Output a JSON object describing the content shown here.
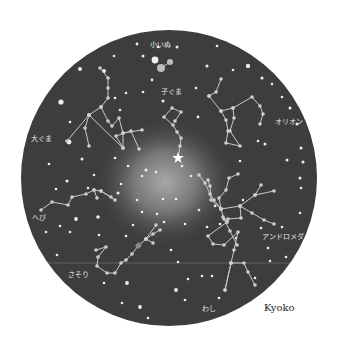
{
  "chart": {
    "center": [
      169,
      178
    ],
    "radius": 148,
    "sky_color": "#3d3d3d",
    "glow_center": [
      165,
      182
    ],
    "glow_color": "#9a9a9a",
    "line_color": "#c8c8c8",
    "star_color": "#eeeeee",
    "horizon_y": 263,
    "horizon_color": "#7a7a7a",
    "pole_star": {
      "x": 178,
      "y": 158
    }
  },
  "labels": {
    "koinu": "小いぬ",
    "kogumа": "子ぐま",
    "ookuma": "大ぐま",
    "orion": "オリオン",
    "hebi": "へび",
    "andromeda": "アンドロメダ",
    "sasori": "さそり",
    "washi": "わし"
  },
  "credit": "Kyoko",
  "constellations": [
    {
      "name": "koinu",
      "points": [
        [
          161,
          68
        ],
        [
          170,
          62
        ]
      ]
    },
    {
      "name": "kogumа",
      "points": [
        [
          178,
          158
        ],
        [
          180,
          146
        ],
        [
          181,
          138
        ],
        [
          177,
          132
        ],
        [
          173,
          125
        ],
        [
          164,
          117
        ],
        [
          172,
          108
        ],
        [
          181,
          112
        ],
        [
          175,
          121
        ]
      ]
    },
    {
      "name": "ookuma",
      "points": [
        [
          100,
          68
        ],
        [
          108,
          78
        ],
        [
          108,
          88
        ],
        [
          108,
          98
        ],
        [
          101,
          107
        ],
        [
          89,
          115
        ],
        [
          67,
          141
        ]
      ],
      "extra": [
        [
          [
            101,
            107
          ],
          [
            108,
            121
          ],
          [
            112,
            126
          ],
          [
            119,
            118
          ],
          [
            123,
            133
          ],
          [
            123,
            148
          ]
        ],
        [
          [
            89,
            115
          ],
          [
            85,
            128
          ],
          [
            89,
            146
          ]
        ],
        [
          [
            89,
            115
          ],
          [
            123,
            148
          ],
          [
            116,
            136
          ],
          [
            131,
            131
          ],
          [
            139,
            149
          ]
        ],
        [
          [
            123,
            133
          ],
          [
            142,
            130
          ]
        ]
      ]
    },
    {
      "name": "orion",
      "points": [
        [
          221,
          79
        ],
        [
          216,
          92
        ],
        [
          209,
          96
        ]
      ],
      "extra": [
        [
          [
            209,
            96
          ],
          [
            221,
            111
          ],
          [
            226,
            120
          ],
          [
            228,
            131
          ],
          [
            226,
            143
          ],
          [
            240,
            146
          ],
          [
            230,
            131
          ],
          [
            234,
            118
          ],
          [
            233,
            108
          ],
          [
            252,
            97
          ],
          [
            260,
            106
          ],
          [
            263,
            114
          ],
          [
            260,
            124
          ]
        ],
        [
          [
            221,
            111
          ],
          [
            233,
            108
          ]
        ]
      ]
    },
    {
      "name": "hebi",
      "points": [
        [
          41,
          210
        ],
        [
          52,
          202
        ],
        [
          68,
          205
        ],
        [
          72,
          197
        ],
        [
          86,
          194
        ],
        [
          94,
          190
        ],
        [
          101,
          191
        ],
        [
          111,
          197
        ]
      ],
      "extra": [
        [
          [
            94,
            190
          ],
          [
            97,
            198
          ]
        ],
        [
          [
            101,
            191
          ],
          [
            115,
            200
          ]
        ]
      ]
    },
    {
      "name": "andromeda",
      "points": [
        [
          199,
          175
        ],
        [
          205,
          183
        ],
        [
          210,
          194
        ],
        [
          214,
          200
        ],
        [
          221,
          209
        ],
        [
          240,
          206
        ],
        [
          255,
          195
        ],
        [
          274,
          191
        ]
      ],
      "extra": [
        [
          [
            221,
            209
          ],
          [
            224,
            219
          ],
          [
            230,
            231
          ],
          [
            237,
            245
          ]
        ],
        [
          [
            240,
            206
          ],
          [
            241,
            218
          ],
          [
            228,
            219
          ]
        ],
        [
          [
            240,
            206
          ],
          [
            252,
            213
          ],
          [
            264,
            220
          ],
          [
            274,
            224
          ]
        ],
        [
          [
            221,
            209
          ],
          [
            211,
            200
          ],
          [
            210,
            186
          ],
          [
            208,
            180
          ]
        ],
        [
          [
            221,
            209
          ],
          [
            219,
            198
          ],
          [
            226,
            190
          ],
          [
            229,
            178
          ],
          [
            238,
            174
          ]
        ],
        [
          [
            255,
            195
          ],
          [
            261,
            185
          ]
        ]
      ]
    },
    {
      "name": "sasori",
      "points": [
        [
          96,
          250
        ],
        [
          106,
          247
        ],
        [
          98,
          257
        ],
        [
          97,
          266
        ],
        [
          107,
          273
        ],
        [
          115,
          273
        ],
        [
          121,
          263
        ],
        [
          126,
          260
        ],
        [
          132,
          254
        ],
        [
          138,
          246
        ],
        [
          146,
          239
        ],
        [
          153,
          234
        ],
        [
          160,
          230
        ]
      ],
      "extra": [
        [
          [
            146,
            239
          ],
          [
            153,
            243
          ]
        ],
        [
          [
            146,
            239
          ],
          [
            156,
            225
          ]
        ]
      ]
    },
    {
      "name": "washi",
      "points": [
        [
          225,
          290
        ],
        [
          231,
          263
        ],
        [
          234,
          250
        ],
        [
          238,
          232
        ],
        [
          224,
          245
        ],
        [
          213,
          244
        ],
        [
          208,
          236
        ],
        [
          227,
          222
        ]
      ],
      "extra": [
        [
          [
            231,
            263
          ],
          [
            244,
            263
          ],
          [
            248,
            272
          ],
          [
            255,
            285
          ]
        ],
        [
          [
            231,
            263
          ],
          [
            225,
            290
          ]
        ],
        [
          [
            227,
            222
          ],
          [
            223,
            217
          ]
        ]
      ]
    }
  ],
  "stars": [
    [
      137,
      44,
      1.4
    ],
    [
      158,
      47,
      1.3
    ],
    [
      155,
      60,
      3.4
    ],
    [
      114,
      56,
      1.3
    ],
    [
      104,
      71,
      2.0
    ],
    [
      80,
      69,
      2.0
    ],
    [
      61,
      102,
      2.6
    ],
    [
      70,
      122,
      1.3
    ],
    [
      49,
      164,
      1.3
    ],
    [
      82,
      159,
      1.5
    ],
    [
      69,
      142,
      2.4
    ],
    [
      143,
      56,
      1.5
    ],
    [
      152,
      80,
      1.4
    ],
    [
      177,
      47,
      1.5
    ],
    [
      207,
      66,
      1.5
    ],
    [
      217,
      46,
      1.3
    ],
    [
      248,
      66,
      2.2
    ],
    [
      233,
      70,
      1.3
    ],
    [
      262,
      78,
      1.6
    ],
    [
      272,
      84,
      1.3
    ],
    [
      282,
      97,
      1.3
    ],
    [
      290,
      108,
      1.5
    ],
    [
      297,
      124,
      1.5
    ],
    [
      301,
      148,
      1.5
    ],
    [
      303,
      162,
      1.5
    ],
    [
      300,
      178,
      1.5
    ],
    [
      287,
      160,
      1.5
    ],
    [
      265,
      144,
      1.5
    ],
    [
      258,
      141,
      1.3
    ],
    [
      240,
      161,
      1.3
    ],
    [
      198,
      117,
      1.4
    ],
    [
      143,
      92,
      1.3
    ],
    [
      163,
      101,
      1.5
    ],
    [
      196,
      88,
      1.3
    ],
    [
      126,
      93,
      1.3
    ],
    [
      115,
      98,
      1.3
    ],
    [
      56,
      189,
      1.3
    ],
    [
      67,
      181,
      1.6
    ],
    [
      60,
      226,
      1.3
    ],
    [
      46,
      232,
      1.3
    ],
    [
      76,
      219,
      1.9
    ],
    [
      118,
      193,
      1.5
    ],
    [
      98,
      217,
      1.8
    ],
    [
      137,
      200,
      1.3
    ],
    [
      126,
      236,
      1.3
    ],
    [
      142,
      212,
      1.3
    ],
    [
      157,
      214,
      1.3
    ],
    [
      164,
      222,
      1.3
    ],
    [
      199,
      210,
      1.3
    ],
    [
      215,
      206,
      1.3
    ],
    [
      236,
      238,
      1.3
    ],
    [
      261,
      228,
      1.3
    ],
    [
      270,
      261,
      1.3
    ],
    [
      268,
      248,
      1.3
    ],
    [
      255,
      278,
      1.3
    ],
    [
      286,
      257,
      1.3
    ],
    [
      282,
      227,
      1.3
    ],
    [
      300,
      213,
      1.3
    ],
    [
      301,
      188,
      1.3
    ],
    [
      243,
      200,
      1.3
    ],
    [
      191,
      176,
      1.3
    ],
    [
      176,
      199,
      1.3
    ],
    [
      163,
      199,
      1.3
    ],
    [
      182,
      166,
      1.3
    ],
    [
      146,
      170,
      1.5
    ],
    [
      128,
      166,
      1.3
    ],
    [
      142,
      176,
      1.3
    ],
    [
      121,
      184,
      1.3
    ],
    [
      171,
      250,
      1.3
    ],
    [
      178,
      262,
      1.3
    ],
    [
      176,
      290,
      1.9
    ],
    [
      185,
      300,
      1.3
    ],
    [
      219,
      298,
      1.3
    ],
    [
      212,
      276,
      1.3
    ],
    [
      188,
      279,
      1.3
    ],
    [
      127,
      283,
      1.9
    ],
    [
      104,
      283,
      1.3
    ],
    [
      122,
      303,
      1.3
    ],
    [
      140,
      307,
      1.9
    ],
    [
      148,
      318,
      1.3
    ],
    [
      57,
      255,
      1.3
    ],
    [
      185,
      224,
      1.3
    ],
    [
      202,
      276,
      1.3
    ],
    [
      220,
      224,
      1.3
    ],
    [
      207,
      227,
      1.3
    ],
    [
      120,
      110,
      1.3
    ],
    [
      156,
      172,
      1.3
    ],
    [
      115,
      158,
      1.3
    ],
    [
      94,
      175,
      1.3
    ],
    [
      88,
      188,
      1.3
    ],
    [
      70,
      232,
      1.3
    ],
    [
      133,
      225,
      1.3
    ],
    [
      99,
      235,
      1.3
    ]
  ]
}
